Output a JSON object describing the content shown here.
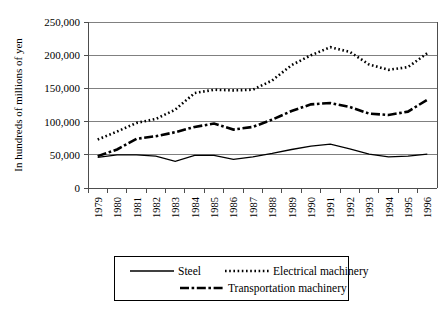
{
  "chart_data": {
    "type": "line",
    "title": "",
    "xlabel": "",
    "ylabel": "In hundreds of millions of yen",
    "x": [
      1979,
      1980,
      1981,
      1982,
      1983,
      1984,
      1985,
      1986,
      1987,
      1988,
      1989,
      1990,
      1991,
      1992,
      1993,
      1994,
      1995,
      1996
    ],
    "categories": [
      "1979",
      "1980",
      "1981",
      "1982",
      "1983",
      "1984",
      "1985",
      "1986",
      "1987",
      "1988",
      "1989",
      "1990",
      "1991",
      "1992",
      "1993",
      "1994",
      "1995",
      "1996"
    ],
    "ylim": [
      0,
      250000
    ],
    "yticks": [
      0,
      50000,
      100000,
      150000,
      200000,
      250000
    ],
    "ytick_labels": [
      "0",
      "50,000",
      "100,000",
      "150,000",
      "200,000",
      "250,000"
    ],
    "grid": true,
    "legend_position": "bottom",
    "series": [
      {
        "name": "Steel",
        "style": "solid",
        "values": [
          46000,
          50000,
          50000,
          48000,
          40000,
          49000,
          49000,
          43000,
          47000,
          52000,
          58000,
          63000,
          66000,
          59000,
          51000,
          47000,
          48000,
          51000
        ]
      },
      {
        "name": "Electrical machinery",
        "style": "dotted",
        "values": [
          73000,
          85000,
          98000,
          104000,
          118000,
          143000,
          148000,
          147000,
          148000,
          162000,
          185000,
          200000,
          212000,
          205000,
          186000,
          178000,
          182000,
          203000
        ]
      },
      {
        "name": "Transportation machinery",
        "style": "dashdot",
        "values": [
          48000,
          58000,
          74000,
          78000,
          84000,
          92000,
          97000,
          88000,
          92000,
          103000,
          116000,
          126000,
          128000,
          122000,
          112000,
          110000,
          115000,
          133000
        ]
      }
    ]
  },
  "legend": {
    "entries": [
      {
        "label": "Steel",
        "style": "solid"
      },
      {
        "label": "Electrical machinery",
        "style": "dotted"
      },
      {
        "label": "Transportation machinery",
        "style": "dashdot"
      }
    ]
  },
  "colors": {
    "series_stroke": "#000000",
    "gridline": "#808080",
    "axis": "#4d4d4d",
    "background": "#ffffff"
  }
}
